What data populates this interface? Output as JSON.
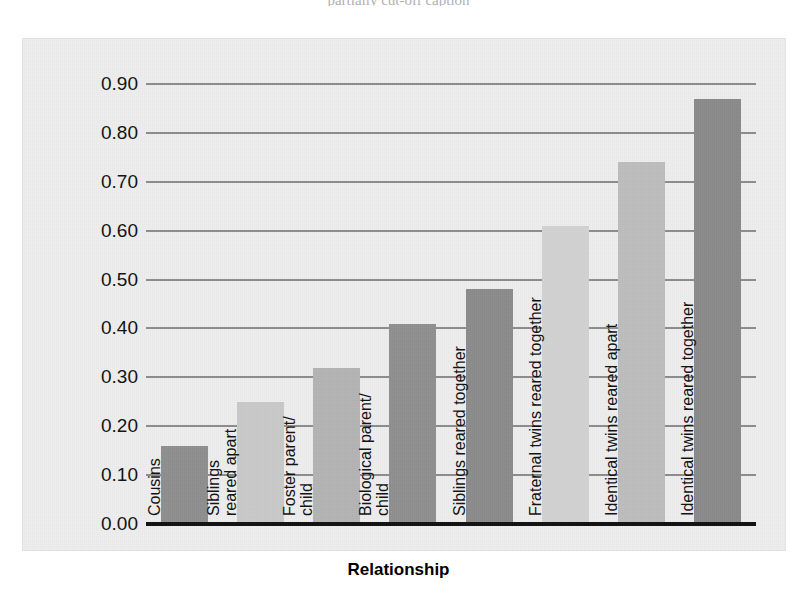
{
  "top_clipped_text": "partially cut-off caption",
  "chart_data": {
    "type": "bar",
    "title": "",
    "xlabel": "Relationship",
    "ylabel": "Average correlations between IQ scores",
    "ylim": [
      0.0,
      0.9
    ],
    "grid": true,
    "legend": "none",
    "ytick_labels": [
      "0.90",
      "0.80",
      "0.70",
      "0.60",
      "0.50",
      "0.40",
      "0.30",
      "0.20",
      "0.10",
      "0.00"
    ],
    "ytick_values": [
      0.9,
      0.8,
      0.7,
      0.6,
      0.5,
      0.4,
      0.3,
      0.2,
      0.1,
      0.0
    ],
    "categories": [
      "Cousins",
      "Siblings reared apart",
      "Foster parent/ child",
      "Biological parent/ child",
      "Siblings reared together",
      "Fraternal twins reared together",
      "Identical twins reared apart",
      "Identical twins reared together"
    ],
    "values": [
      0.16,
      0.25,
      0.32,
      0.41,
      0.48,
      0.61,
      0.74,
      0.87
    ],
    "bar_labels": [
      "Cousins",
      "Siblings\nreared apart",
      "Foster parent/\nchild",
      "Biological parent/\nchild",
      "Siblings reared together",
      "Fraternal twins reared together",
      "Identical twins reared apart",
      "Identical twins reared together"
    ],
    "bar_colors": [
      "#8f8f8f",
      "#c9c9c9",
      "#b4b4b4",
      "#909090",
      "#8c8c8c",
      "#d2d2d2",
      "#bdbdbd",
      "#8b8b8b"
    ]
  },
  "colors": {
    "plot_background": "#eeeeee",
    "gridline": "#8d8d8d",
    "axis_line": "#111111",
    "text": "#111111"
  }
}
